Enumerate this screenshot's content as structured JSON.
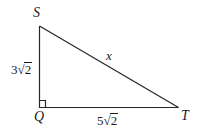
{
  "figure": {
    "type": "right-triangle-diagram",
    "background_color": "#ffffff",
    "stroke_color": "#262626",
    "text_color": "#1a1a1a",
    "vertices": {
      "S": {
        "label": "S",
        "x": 39,
        "y": 26
      },
      "Q": {
        "label": "Q",
        "x": 39,
        "y": 107
      },
      "T": {
        "label": "T",
        "x": 178,
        "y": 107
      }
    },
    "right_angle": {
      "at_vertex": "Q",
      "marker": "square",
      "size_px": 6
    },
    "sides": {
      "vertical_leg": {
        "name": "SQ",
        "label_full": "3√2",
        "coefficient": "3",
        "surd": "√",
        "radicand": "2"
      },
      "horizontal_leg": {
        "name": "QT",
        "label_full": "5√2",
        "coefficient": "5",
        "surd": "√",
        "radicand": "2"
      },
      "hypotenuse": {
        "name": "ST",
        "label_full": "x"
      }
    }
  }
}
